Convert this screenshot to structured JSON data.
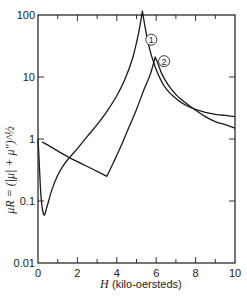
{
  "chart_data": {
    "type": "line",
    "title": "",
    "xlabel": "H (kilo-oersteds)",
    "xlabel_var": "H",
    "xlabel_unit": "(kilo-oersteds)",
    "ylabel": "μR = (|μ| + μ'')^½",
    "xlim": [
      0,
      10
    ],
    "ylim": [
      0.01,
      100
    ],
    "yscale": "log",
    "xticks": [
      0,
      2,
      4,
      6,
      8,
      10
    ],
    "xtick_labels": [
      "0",
      "2",
      "4",
      "6",
      "8",
      "10"
    ],
    "yticks": [
      0.01,
      0.1,
      1,
      10,
      100
    ],
    "ytick_labels": [
      "0.01",
      "0.1",
      "1",
      "10",
      "100"
    ],
    "grid": false,
    "legend": "inline circled numbers",
    "series": [
      {
        "name": "1",
        "label": "①",
        "x": [
          0.0,
          0.05,
          0.15,
          0.3,
          0.45,
          0.7,
          1.0,
          1.3,
          1.6,
          2.0,
          2.5,
          3.0,
          3.5,
          4.0,
          4.4,
          4.8,
          5.1,
          5.3,
          5.45,
          5.6,
          5.8,
          6.1,
          6.5,
          7.0,
          7.5,
          8.0,
          8.5,
          9.0,
          9.5,
          10.0
        ],
        "y": [
          1.0,
          0.5,
          0.12,
          0.06,
          0.08,
          0.15,
          0.26,
          0.38,
          0.5,
          0.7,
          1.1,
          1.7,
          2.8,
          5.0,
          9.0,
          20,
          50,
          115,
          60,
          35,
          20,
          11,
          6.5,
          4.5,
          3.5,
          3.0,
          2.7,
          2.5,
          2.4,
          2.3
        ]
      },
      {
        "name": "2",
        "label": "②",
        "x": [
          0.2,
          0.8,
          1.5,
          2.0,
          2.5,
          3.0,
          3.5,
          3.8,
          4.2,
          4.6,
          5.0,
          5.4,
          5.7,
          5.95,
          6.1,
          6.3,
          6.6,
          7.0,
          7.5,
          8.0,
          8.5,
          9.0,
          9.5,
          10.0
        ],
        "y": [
          0.9,
          0.7,
          0.52,
          0.43,
          0.36,
          0.3,
          0.25,
          0.4,
          0.75,
          1.5,
          3.0,
          6.5,
          11,
          21,
          16,
          11,
          7.5,
          5.2,
          3.8,
          2.9,
          2.3,
          1.9,
          1.7,
          1.5
        ]
      }
    ],
    "annotations": [
      {
        "text": "①",
        "series": "1",
        "x": 5.75,
        "y": 40
      },
      {
        "text": "②",
        "series": "2",
        "x": 6.4,
        "y": 18
      }
    ]
  },
  "labels": {
    "marker1": "1",
    "marker2": "2"
  },
  "colors": {
    "line": "#1a1a1a",
    "background": "#ffffff"
  }
}
